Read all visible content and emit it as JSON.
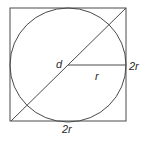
{
  "diagram": {
    "labels": {
      "diameter": "d",
      "radius": "r",
      "side_right": "2r",
      "side_bottom": "2r"
    },
    "geometry": {
      "square": {
        "x": 10,
        "y": 8,
        "width": 116,
        "height": 113
      },
      "circle": {
        "cx": 68,
        "cy": 65,
        "rx": 58,
        "ry": 57
      },
      "diagonal": {
        "x1": 11,
        "y1": 121,
        "x2": 126,
        "y2": 8
      },
      "radius_line": {
        "x1": 68,
        "y1": 65,
        "x2": 126,
        "y2": 65
      }
    },
    "colors": {
      "stroke": "#4a4a4a",
      "text": "#2a2a2a",
      "background": "#ffffff"
    }
  }
}
